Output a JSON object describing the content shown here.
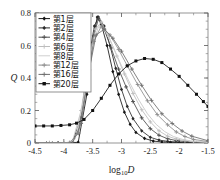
{
  "chart_data": {
    "type": "line",
    "title": "",
    "xlabel": "log10D",
    "xlabel_display": "log₁₀D",
    "ylabel": "Q",
    "xlim": [
      -4.5,
      -1.5
    ],
    "ylim": [
      0.0,
      0.8
    ],
    "xticks": [
      -4.5,
      -4,
      -3.5,
      -3,
      -2.5,
      -2,
      -1.5
    ],
    "xticklabels": [
      "-4.5",
      "-4",
      "-3.5",
      "-3",
      "-2.5",
      "-2",
      "-1.5"
    ],
    "yticks": [
      0,
      0.2,
      0.4,
      0.6,
      0.8
    ],
    "yticklabels": [
      "0",
      "0.2",
      "0.4",
      "0.6",
      "0.8"
    ],
    "grid": false,
    "legend_position": "upper-left",
    "minor_ticks": true,
    "series": [
      {
        "name": "第1层",
        "color": "#141414",
        "marker": "diamond",
        "x": [
          -4.5,
          -4.3,
          -4.1,
          -3.9,
          -3.75,
          -3.6,
          -3.5,
          -3.42,
          -3.35,
          -3.25,
          -3.15,
          -3.05,
          -2.95,
          -2.85,
          -2.75,
          -2.6,
          -2.45,
          -2.3,
          -2.15,
          -2.0,
          -1.85,
          -1.7,
          -1.5
        ],
        "y": [
          0.0,
          0.0,
          0.0,
          0.0,
          0.005,
          0.3,
          0.62,
          0.775,
          0.73,
          0.6,
          0.44,
          0.3,
          0.19,
          0.115,
          0.065,
          0.028,
          0.012,
          0.006,
          0.004,
          0.003,
          0.002,
          0.002,
          0.002
        ]
      },
      {
        "name": "第2层",
        "color": "#2b2b2b",
        "marker": "diamond",
        "x": [
          -4.5,
          -4.2,
          -4.0,
          -3.85,
          -3.7,
          -3.58,
          -3.47,
          -3.4,
          -3.3,
          -3.2,
          -3.1,
          -3.0,
          -2.9,
          -2.8,
          -2.65,
          -2.5,
          -2.35,
          -2.2,
          -2.05,
          -1.9,
          -1.75,
          -1.5
        ],
        "y": [
          0.0,
          0.0,
          0.0,
          0.003,
          0.16,
          0.5,
          0.72,
          0.775,
          0.72,
          0.6,
          0.46,
          0.33,
          0.225,
          0.15,
          0.075,
          0.035,
          0.018,
          0.01,
          0.006,
          0.004,
          0.003,
          0.002
        ]
      },
      {
        "name": "第4层",
        "color": "#4a4a4a",
        "marker": "plus",
        "x": [
          -4.5,
          -4.1,
          -3.9,
          -3.75,
          -3.6,
          -3.48,
          -3.4,
          -3.3,
          -3.18,
          -3.05,
          -2.92,
          -2.8,
          -2.65,
          -2.5,
          -2.35,
          -2.2,
          -2.05,
          -1.9,
          -1.75,
          -1.5
        ],
        "y": [
          0.0,
          0.0,
          0.002,
          0.06,
          0.38,
          0.66,
          0.765,
          0.7,
          0.585,
          0.455,
          0.345,
          0.255,
          0.155,
          0.088,
          0.048,
          0.026,
          0.015,
          0.009,
          0.005,
          0.003
        ]
      },
      {
        "name": "第6层",
        "color": "#bdbdbd",
        "marker": "plus",
        "x": [
          -4.5,
          -4.0,
          -3.85,
          -3.7,
          -3.55,
          -3.45,
          -3.35,
          -3.22,
          -3.08,
          -2.95,
          -2.8,
          -2.65,
          -2.5,
          -2.35,
          -2.2,
          -2.05,
          -1.9,
          -1.75,
          -1.5
        ],
        "y": [
          0.0,
          0.0,
          0.01,
          0.2,
          0.54,
          0.7,
          0.745,
          0.655,
          0.535,
          0.425,
          0.305,
          0.205,
          0.13,
          0.075,
          0.042,
          0.024,
          0.014,
          0.008,
          0.004
        ]
      },
      {
        "name": "第8层",
        "color": "#cfcfcf",
        "marker": "none",
        "x": [
          -4.5,
          -3.95,
          -3.8,
          -3.65,
          -3.52,
          -3.4,
          -3.28,
          -3.15,
          -3.0,
          -2.85,
          -2.7,
          -2.55,
          -2.4,
          -2.25,
          -2.1,
          -1.95,
          -1.8,
          -1.5
        ],
        "y": [
          0.0,
          0.0,
          0.025,
          0.28,
          0.58,
          0.715,
          0.69,
          0.595,
          0.475,
          0.365,
          0.265,
          0.18,
          0.115,
          0.07,
          0.04,
          0.023,
          0.013,
          0.005
        ]
      },
      {
        "name": "第12层",
        "color": "#8c8c8c",
        "marker": "plus",
        "x": [
          -4.5,
          -3.9,
          -3.75,
          -3.6,
          -3.48,
          -3.35,
          -3.2,
          -3.05,
          -2.9,
          -2.72,
          -2.55,
          -2.38,
          -2.2,
          -2.05,
          -1.9,
          -1.75,
          -1.5
        ],
        "y": [
          0.0,
          0.0,
          0.06,
          0.36,
          0.625,
          0.72,
          0.665,
          0.575,
          0.475,
          0.36,
          0.26,
          0.175,
          0.112,
          0.068,
          0.04,
          0.022,
          0.009
        ]
      },
      {
        "name": "第16层",
        "color": "#6e6e6e",
        "marker": "plus",
        "x": [
          -4.5,
          -3.85,
          -3.7,
          -3.56,
          -3.44,
          -3.3,
          -3.15,
          -3.0,
          -2.82,
          -2.65,
          -2.48,
          -2.3,
          -2.12,
          -1.95,
          -1.78,
          -1.5
        ],
        "y": [
          0.0,
          0.0,
          0.12,
          0.45,
          0.665,
          0.7,
          0.645,
          0.565,
          0.455,
          0.355,
          0.262,
          0.18,
          0.12,
          0.074,
          0.042,
          0.014
        ]
      },
      {
        "name": "第20层",
        "color": "#111111",
        "marker": "square",
        "x": [
          -4.5,
          -4.35,
          -4.2,
          -4.05,
          -3.9,
          -3.78,
          -3.65,
          -3.5,
          -3.35,
          -3.2,
          -3.05,
          -2.9,
          -2.75,
          -2.6,
          -2.45,
          -2.3,
          -2.15,
          -2.0,
          -1.85,
          -1.7,
          -1.58,
          -1.5
        ],
        "y": [
          0.105,
          0.105,
          0.105,
          0.108,
          0.112,
          0.122,
          0.145,
          0.2,
          0.275,
          0.355,
          0.425,
          0.475,
          0.505,
          0.52,
          0.515,
          0.495,
          0.455,
          0.41,
          0.355,
          0.3,
          0.255,
          0.225
        ]
      }
    ]
  }
}
